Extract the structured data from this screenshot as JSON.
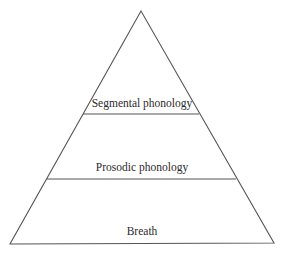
{
  "diagram": {
    "type": "pyramid",
    "colors": {
      "line": "#555555",
      "text": "#2a2a2a",
      "background": "#ffffff"
    },
    "layers": [
      {
        "label": "Segmental phonology",
        "position": "top"
      },
      {
        "label": "Prosodic phonology",
        "position": "middle"
      },
      {
        "label": "Breath",
        "position": "bottom"
      }
    ]
  }
}
